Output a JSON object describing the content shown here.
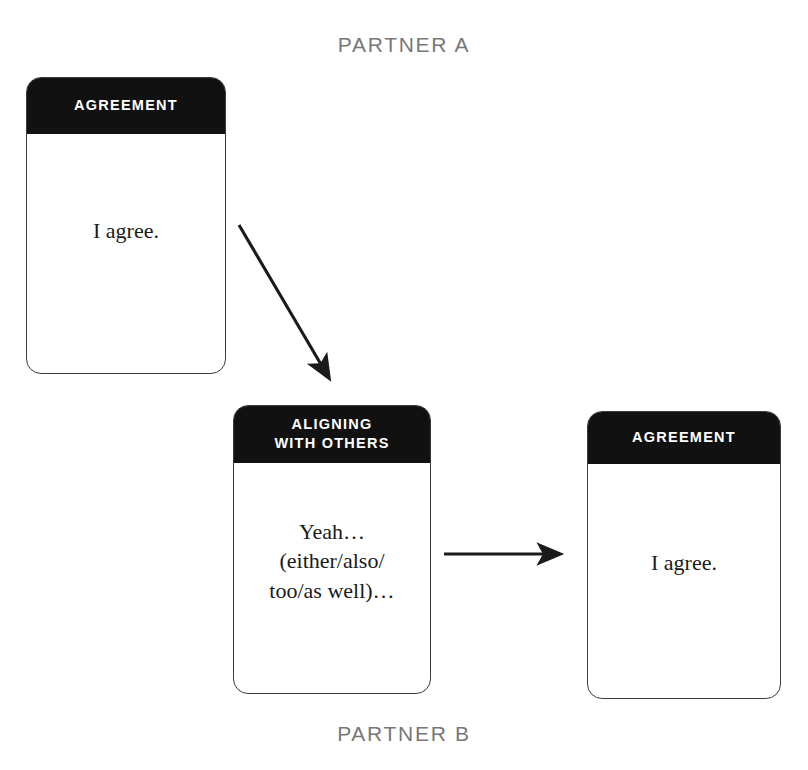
{
  "diagram": {
    "title_top": "PARTNER A",
    "title_bottom": "PARTNER B",
    "label_color": "#77777a",
    "header_bg": "#111111",
    "header_text_color": "#ffffff",
    "card_border_color": "#3b3b3b",
    "arrow_color": "#1a1a1a",
    "background": "#ffffff"
  },
  "cards": [
    {
      "id": "agreement-a",
      "header": "AGREEMENT",
      "body": "I agree.",
      "owner": "PARTNER A"
    },
    {
      "id": "aligning-with-others",
      "header": "ALIGNING\nWITH OTHERS",
      "body": "Yeah…\n(either/also/\ntoo/as well)…",
      "owner": "PARTNER B"
    },
    {
      "id": "agreement-b",
      "header": "AGREEMENT",
      "body": "I agree.",
      "owner": "PARTNER B"
    }
  ],
  "arrows": [
    {
      "id": "arrow-diagonal",
      "from": "agreement-a",
      "to": "aligning-with-others",
      "direction": "down-right"
    },
    {
      "id": "arrow-horizontal",
      "from": "aligning-with-others",
      "to": "agreement-b",
      "direction": "right"
    }
  ]
}
